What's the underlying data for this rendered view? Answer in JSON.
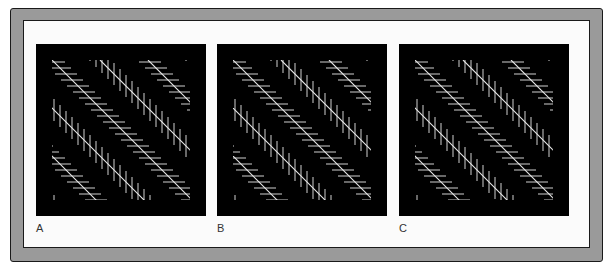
{
  "figure": {
    "panels": [
      {
        "id": "A",
        "label": "A",
        "left": 36
      },
      {
        "id": "B",
        "label": "B",
        "left": 217
      },
      {
        "id": "C",
        "label": "C",
        "left": 399
      }
    ],
    "pattern": {
      "description": "Zollner-type illusion: parallel diagonal lines overlaid on alternating bands of horizontal and vertical hatching",
      "line_color": "#e8e8e8",
      "background_color": "#000000",
      "diagonal_spacing": 48,
      "diagonal_slope": 1.0,
      "hatch_spacing": 6,
      "hatch_length": 22,
      "inset": 16
    },
    "colors": {
      "frame": "#9a9a9a",
      "frame_edge": "#1a1a1a",
      "inner": "#fbfbfb"
    }
  }
}
